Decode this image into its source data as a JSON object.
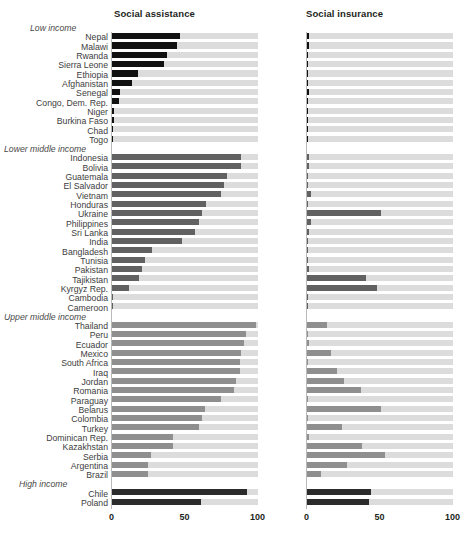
{
  "figure": {
    "top_cropped_text": "",
    "footnote_cropped_text": "",
    "panels": [
      {
        "key": "social_assistance",
        "title": "Social assistance"
      },
      {
        "key": "social_insurance",
        "title": "Social insurance"
      }
    ],
    "axis": {
      "ticks": [
        "0",
        "50",
        "100"
      ],
      "tick_values": [
        0,
        50,
        100
      ],
      "min": 0,
      "max": 100
    },
    "colors": {
      "track": "#dcdcdc",
      "low_income_fill": "#111111",
      "lower_middle_fill": "#616161",
      "upper_middle_fill": "#8f8f8f",
      "high_income_fill": "#2b2b2b",
      "title": "#231f20",
      "label": "#3d3d3d"
    }
  },
  "chart_data": {
    "type": "bar",
    "title": "",
    "subtitle": "",
    "xlabel": "",
    "ylabel": "",
    "xlim": [
      0,
      100
    ],
    "grid": false,
    "legend": null,
    "orientation": "horizontal",
    "panel_titles": [
      "Social assistance",
      "Social insurance"
    ],
    "xticks": [
      0,
      50,
      100
    ],
    "xticklabels": [
      "0",
      "50",
      "100"
    ],
    "groups": [
      {
        "name": "Low income",
        "fill_color": "#111111",
        "rows": [
          {
            "label": "Nepal",
            "social_assistance": 47,
            "social_insurance": 1.5
          },
          {
            "label": "Malawi",
            "social_assistance": 45,
            "social_insurance": 1.5
          },
          {
            "label": "Rwanda",
            "social_assistance": 38,
            "social_insurance": 0.8
          },
          {
            "label": "Sierra Leone",
            "social_assistance": 36,
            "social_insurance": 0.8
          },
          {
            "label": "Ethiopia",
            "social_assistance": 18,
            "social_insurance": 0.3
          },
          {
            "label": "Afghanistan",
            "social_assistance": 14,
            "social_insurance": 0.3
          },
          {
            "label": "Senegal",
            "social_assistance": 6,
            "social_insurance": 1.5
          },
          {
            "label": "Congo, Dem. Rep.",
            "social_assistance": 5,
            "social_insurance": 1.2
          },
          {
            "label": "Niger",
            "social_assistance": 2,
            "social_insurance": 1.0
          },
          {
            "label": "Burkina Faso",
            "social_assistance": 2,
            "social_insurance": 1.0
          },
          {
            "label": "Chad",
            "social_assistance": 0.6,
            "social_insurance": 1.0
          },
          {
            "label": "Togo",
            "social_assistance": 0.3,
            "social_insurance": 0.8
          }
        ]
      },
      {
        "name": "Lower middle income",
        "fill_color": "#616161",
        "rows": [
          {
            "label": "Indonesia",
            "social_assistance": 89,
            "social_insurance": 1.6
          },
          {
            "label": "Bolivia",
            "social_assistance": 89,
            "social_insurance": 1.6
          },
          {
            "label": "Guatemala",
            "social_assistance": 79,
            "social_insurance": 0.8
          },
          {
            "label": "El Salvador",
            "social_assistance": 77,
            "social_insurance": 0.8
          },
          {
            "label": "Vietnam",
            "social_assistance": 75,
            "social_insurance": 3.0
          },
          {
            "label": "Honduras",
            "social_assistance": 65,
            "social_insurance": 0.8
          },
          {
            "label": "Ukraine",
            "social_assistance": 62,
            "social_insurance": 51
          },
          {
            "label": "Philippines",
            "social_assistance": 60,
            "social_insurance": 3.0
          },
          {
            "label": "Sri Lanka",
            "social_assistance": 57,
            "social_insurance": 2.0
          },
          {
            "label": "India",
            "social_assistance": 48,
            "social_insurance": 0.3
          },
          {
            "label": "Bangladesh",
            "social_assistance": 28,
            "social_insurance": 0.3
          },
          {
            "label": "Tunisia",
            "social_assistance": 23,
            "social_insurance": 0.3
          },
          {
            "label": "Pakistan",
            "social_assistance": 21,
            "social_insurance": 1.5
          },
          {
            "label": "Tajikistan",
            "social_assistance": 19,
            "social_insurance": 41
          },
          {
            "label": "Kyrgyz Rep.",
            "social_assistance": 12,
            "social_insurance": 48
          },
          {
            "label": "Cambodia",
            "social_assistance": 0.4,
            "social_insurance": 0.4
          },
          {
            "label": "Cameroon",
            "social_assistance": 0.4,
            "social_insurance": 1.0
          }
        ]
      },
      {
        "name": "Upper middle income",
        "fill_color": "#8f8f8f",
        "rows": [
          {
            "label": "Thailand",
            "social_assistance": 99,
            "social_insurance": 14
          },
          {
            "label": "Peru",
            "social_assistance": 92,
            "social_insurance": 1.2
          },
          {
            "label": "Ecuador",
            "social_assistance": 91,
            "social_insurance": 2.0
          },
          {
            "label": "Mexico",
            "social_assistance": 89,
            "social_insurance": 17
          },
          {
            "label": "South Africa",
            "social_assistance": 88,
            "social_insurance": 1.0
          },
          {
            "label": "Iraq",
            "social_assistance": 88,
            "social_insurance": 21
          },
          {
            "label": "Jordan",
            "social_assistance": 85,
            "social_insurance": 26
          },
          {
            "label": "Romania",
            "social_assistance": 84,
            "social_insurance": 37
          },
          {
            "label": "Paraguay",
            "social_assistance": 75,
            "social_insurance": 1.0
          },
          {
            "label": "Belarus",
            "social_assistance": 64,
            "social_insurance": 51
          },
          {
            "label": "Colombia",
            "social_assistance": 62,
            "social_insurance": 0.8
          },
          {
            "label": "Turkey",
            "social_assistance": 60,
            "social_insurance": 24
          },
          {
            "label": "Dominican Rep.",
            "social_assistance": 42,
            "social_insurance": 1.5
          },
          {
            "label": "Kazakhstan",
            "social_assistance": 42,
            "social_insurance": 38
          },
          {
            "label": "Serbia",
            "social_assistance": 27,
            "social_insurance": 54
          },
          {
            "label": "Argentina",
            "social_assistance": 25,
            "social_insurance": 28
          },
          {
            "label": "Brazil",
            "social_assistance": 25,
            "social_insurance": 10
          }
        ]
      },
      {
        "name": "High income",
        "fill_color": "#2b2b2b",
        "rows": [
          {
            "label": "Chile",
            "social_assistance": 93,
            "social_insurance": 44
          },
          {
            "label": "Poland",
            "social_assistance": 61,
            "social_insurance": 43
          }
        ]
      }
    ]
  }
}
